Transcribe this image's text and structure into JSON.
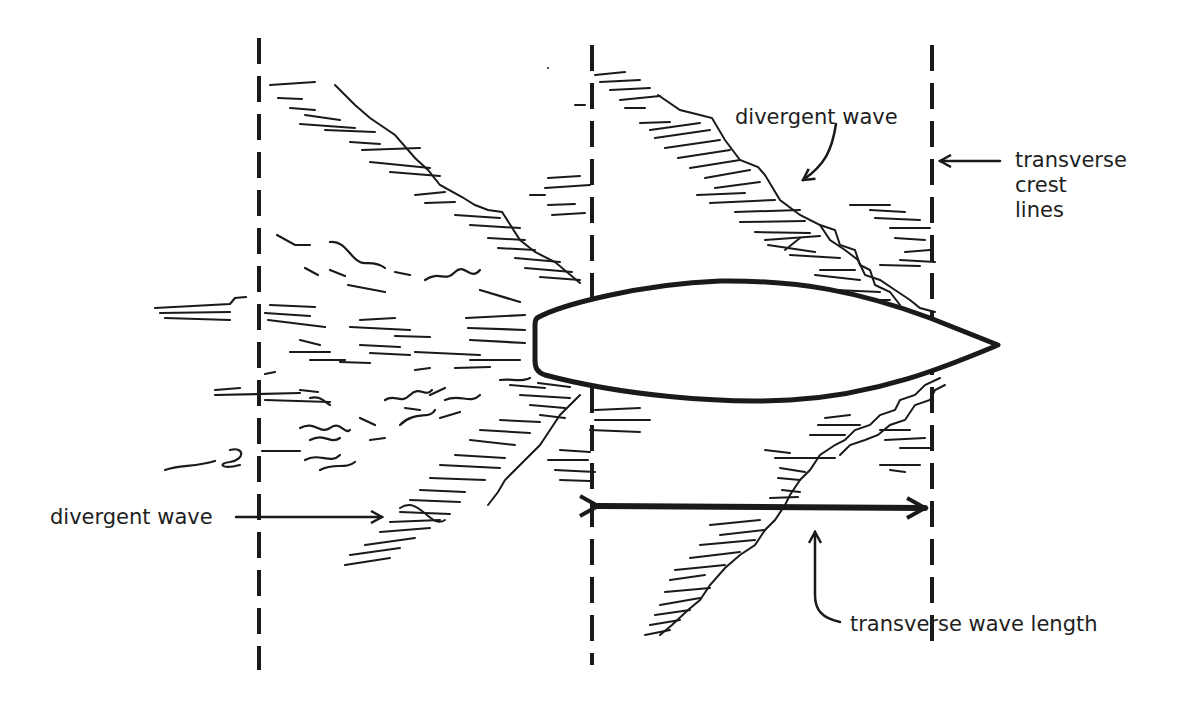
{
  "diagram": {
    "labels": {
      "divergent_wave_top": "divergent wave",
      "transverse_crest_lines": [
        "transverse",
        "crest",
        "lines"
      ],
      "divergent_wave_left": "divergent wave",
      "transverse_wave_length": "transverse wave length"
    },
    "elements": {
      "hull": "ship hull outline, bow pointing right",
      "crest_lines": "three vertical dashed transverse crest lines",
      "measurement": "double-headed arrow between second and third crest lines"
    },
    "colors": {
      "ink": "#1a1a1a",
      "background": "#ffffff"
    }
  }
}
